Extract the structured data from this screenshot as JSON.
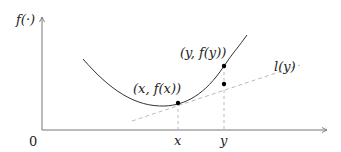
{
  "diagram": {
    "y_axis_label": "f(·)",
    "origin_label": "0",
    "x_tick_x": "x",
    "x_tick_y": "y",
    "point_x_label": "(x, f(x))",
    "point_y_label": "(y, f(y))",
    "tangent_label": "l(y)",
    "colors": {
      "axis": "#777777",
      "curve": "#333333",
      "tangent": "#bbbbbb",
      "point": "#000000"
    }
  }
}
